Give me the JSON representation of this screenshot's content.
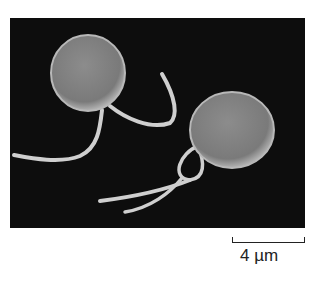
{
  "figure": {
    "type": "scanning electron micrograph",
    "background_color": "#0d0d0d",
    "cell_color": "#8a8a8a"
  },
  "scale_bar": {
    "label": "4 µm"
  }
}
